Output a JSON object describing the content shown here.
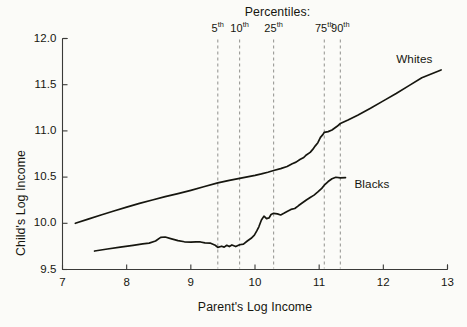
{
  "chart_data": {
    "type": "line",
    "title": "",
    "xlabel": "Parent's Log Income",
    "ylabel": "Child's Log Income",
    "xlim": [
      7,
      13
    ],
    "ylim": [
      9.5,
      12.0
    ],
    "xticks": [
      "7",
      "8",
      "9",
      "10",
      "11",
      "12",
      "13"
    ],
    "yticks": [
      "12.0",
      "11.5",
      "11.0",
      "10.5",
      "10.0",
      "9.5"
    ],
    "grid": false,
    "legend_position": "inline-right-of-curve-ends",
    "annotations": {
      "percentiles_title": "Percentiles:",
      "percentile_lines": [
        {
          "label": "5",
          "suffix": "th",
          "x": 9.42
        },
        {
          "label": "10",
          "suffix": "th",
          "x": 9.76
        },
        {
          "label": "25",
          "suffix": "th",
          "x": 10.29
        },
        {
          "label": "75",
          "suffix": "th",
          "x": 11.08
        },
        {
          "label": "90",
          "suffix": "th",
          "x": 11.33
        }
      ]
    },
    "series": [
      {
        "name": "Whites",
        "label_x": 12.2,
        "label_y": 11.78,
        "points": [
          [
            7.2,
            10.0
          ],
          [
            7.4,
            10.045
          ],
          [
            7.6,
            10.09
          ],
          [
            7.8,
            10.133
          ],
          [
            8.0,
            10.175
          ],
          [
            8.2,
            10.215
          ],
          [
            8.4,
            10.252
          ],
          [
            8.6,
            10.288
          ],
          [
            8.8,
            10.322
          ],
          [
            9.0,
            10.357
          ],
          [
            9.2,
            10.395
          ],
          [
            9.42,
            10.437
          ],
          [
            9.6,
            10.465
          ],
          [
            9.76,
            10.487
          ],
          [
            9.9,
            10.505
          ],
          [
            10.0,
            10.519
          ],
          [
            10.1,
            10.535
          ],
          [
            10.2,
            10.553
          ],
          [
            10.29,
            10.571
          ],
          [
            10.4,
            10.592
          ],
          [
            10.5,
            10.615
          ],
          [
            10.58,
            10.645
          ],
          [
            10.64,
            10.662
          ],
          [
            10.7,
            10.69
          ],
          [
            10.76,
            10.712
          ],
          [
            10.8,
            10.74
          ],
          [
            10.86,
            10.768
          ],
          [
            10.9,
            10.8
          ],
          [
            10.94,
            10.838
          ],
          [
            10.98,
            10.872
          ],
          [
            11.02,
            10.93
          ],
          [
            11.06,
            10.962
          ],
          [
            11.08,
            10.985
          ],
          [
            11.14,
            10.992
          ],
          [
            11.2,
            11.01
          ],
          [
            11.28,
            11.05
          ],
          [
            11.33,
            11.08
          ],
          [
            11.45,
            11.118
          ],
          [
            11.6,
            11.17
          ],
          [
            11.8,
            11.245
          ],
          [
            12.0,
            11.325
          ],
          [
            12.2,
            11.405
          ],
          [
            12.4,
            11.49
          ],
          [
            12.6,
            11.575
          ],
          [
            12.9,
            11.66
          ]
        ]
      },
      {
        "name": "Blacks",
        "label_x": 11.55,
        "label_y": 10.43,
        "points": [
          [
            7.5,
            9.7
          ],
          [
            7.7,
            9.722
          ],
          [
            7.9,
            9.742
          ],
          [
            8.1,
            9.762
          ],
          [
            8.25,
            9.778
          ],
          [
            8.35,
            9.786
          ],
          [
            8.45,
            9.808
          ],
          [
            8.53,
            9.848
          ],
          [
            8.6,
            9.852
          ],
          [
            8.7,
            9.832
          ],
          [
            8.8,
            9.812
          ],
          [
            8.9,
            9.8
          ],
          [
            9.0,
            9.796
          ],
          [
            9.08,
            9.8
          ],
          [
            9.15,
            9.798
          ],
          [
            9.22,
            9.788
          ],
          [
            9.3,
            9.786
          ],
          [
            9.38,
            9.762
          ],
          [
            9.42,
            9.74
          ],
          [
            9.48,
            9.752
          ],
          [
            9.52,
            9.742
          ],
          [
            9.56,
            9.762
          ],
          [
            9.6,
            9.748
          ],
          [
            9.64,
            9.766
          ],
          [
            9.7,
            9.748
          ],
          [
            9.76,
            9.768
          ],
          [
            9.82,
            9.775
          ],
          [
            9.88,
            9.808
          ],
          [
            9.94,
            9.838
          ],
          [
            9.99,
            9.872
          ],
          [
            10.03,
            9.92
          ],
          [
            10.06,
            9.962
          ],
          [
            10.1,
            10.035
          ],
          [
            10.14,
            10.078
          ],
          [
            10.18,
            10.05
          ],
          [
            10.22,
            10.058
          ],
          [
            10.25,
            10.095
          ],
          [
            10.29,
            10.108
          ],
          [
            10.35,
            10.102
          ],
          [
            10.4,
            10.09
          ],
          [
            10.45,
            10.108
          ],
          [
            10.5,
            10.128
          ],
          [
            10.56,
            10.15
          ],
          [
            10.62,
            10.16
          ],
          [
            10.68,
            10.192
          ],
          [
            10.74,
            10.222
          ],
          [
            10.8,
            10.252
          ],
          [
            10.86,
            10.28
          ],
          [
            10.92,
            10.305
          ],
          [
            10.98,
            10.34
          ],
          [
            11.04,
            10.378
          ],
          [
            11.08,
            10.412
          ],
          [
            11.14,
            10.452
          ],
          [
            11.2,
            10.482
          ],
          [
            11.26,
            10.498
          ],
          [
            11.33,
            10.492
          ],
          [
            11.41,
            10.495
          ]
        ]
      }
    ]
  }
}
